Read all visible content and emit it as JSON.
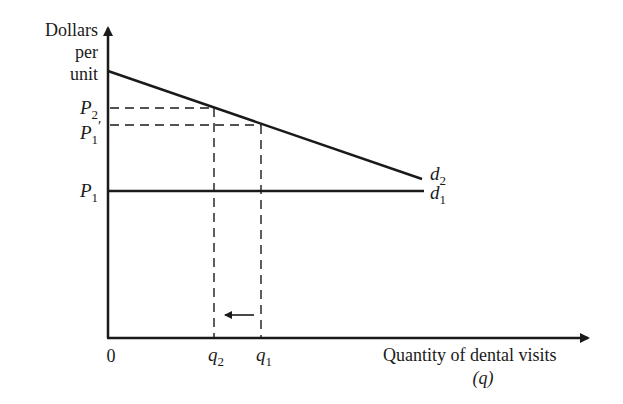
{
  "diagram": {
    "type": "supply-demand",
    "y_axis": {
      "label_lines": [
        "Dollars",
        "per",
        "unit"
      ]
    },
    "x_axis": {
      "label": "Quantity of dental visits",
      "sublabel": "(q)",
      "origin": "0"
    },
    "price_labels": {
      "p2": {
        "base": "P",
        "sub": "2",
        "prime": ""
      },
      "p1_prime": {
        "base": "P",
        "sub": "1",
        "prime": "′"
      },
      "p1": {
        "base": "P",
        "sub": "1",
        "prime": ""
      }
    },
    "quantity_labels": {
      "q2": {
        "base": "q",
        "sub": "2"
      },
      "q1": {
        "base": "q",
        "sub": "1"
      }
    },
    "curves": {
      "d2": {
        "base": "d",
        "sub": "2",
        "description": "downward-sloping demand curve"
      },
      "d1": {
        "base": "d",
        "sub": "1",
        "description": "horizontal demand curve at P1"
      }
    },
    "annotation": "arrow pointing left from q1 to q2",
    "colors": {
      "line": "#1a1a1a",
      "background": "#ffffff"
    }
  }
}
